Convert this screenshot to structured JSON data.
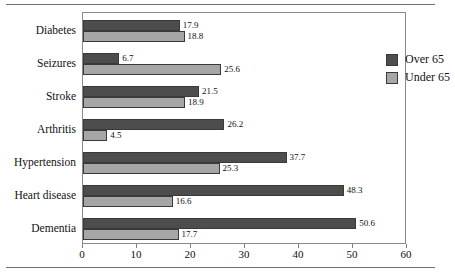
{
  "chart_data": {
    "type": "bar",
    "orientation": "horizontal",
    "title": "",
    "xlabel": "",
    "ylabel": "",
    "xlim": [
      0,
      60
    ],
    "xticks": [
      0,
      10,
      20,
      30,
      40,
      50,
      60
    ],
    "grid": false,
    "legend_position": "top-right",
    "categories": [
      "Diabetes",
      "Seizures",
      "Stroke",
      "Arthritis",
      "Hypertension",
      "Heart disease",
      "Dementia"
    ],
    "series": [
      {
        "name": "Over 65",
        "color": "#4d4d4d",
        "values": [
          17.9,
          6.7,
          21.5,
          26.2,
          37.7,
          48.3,
          50.6
        ]
      },
      {
        "name": "Under 65",
        "color": "#a6a6a6",
        "values": [
          18.8,
          25.6,
          18.9,
          4.5,
          25.3,
          16.6,
          17.7
        ]
      }
    ]
  },
  "legend": {
    "entries": [
      {
        "label": "Over 65",
        "color": "#4d4d4d"
      },
      {
        "label": "Under 65",
        "color": "#a6a6a6"
      }
    ]
  }
}
